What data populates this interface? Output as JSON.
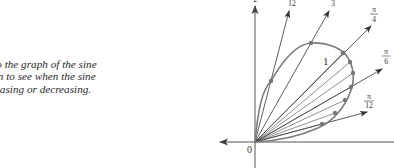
{
  "caption": {
    "lines": [
      "r to the graph of the sine",
      "tion  to see when the sine",
      "creasing or decreasing."
    ]
  },
  "diagram": {
    "origin_label": "0",
    "curve_label": "1",
    "ray_labels": {
      "pi_12": {
        "num": "π",
        "den": "12"
      },
      "pi_6": {
        "num": "π",
        "den": "6"
      },
      "pi_4": {
        "num": "π",
        "den": "4"
      },
      "pi_3": {
        "num": "π",
        "den": "3"
      },
      "five_pi_12": {
        "num": "5π",
        "den": "12"
      },
      "pi_2": {
        "num": "π",
        "den": "2"
      }
    },
    "colors": {
      "curve": "#7a7a7a",
      "rays": "#333333",
      "dots": "#777777",
      "axes": "#555555"
    }
  }
}
